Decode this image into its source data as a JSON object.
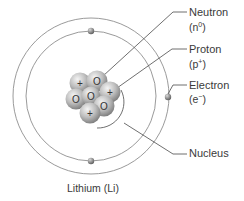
{
  "diagram": {
    "title": "Lithium (Li)",
    "element": "Lithium",
    "symbol": "Li",
    "labels": {
      "neutron": {
        "name": "Neutron",
        "symbol_base": "n",
        "symbol_charge": "0"
      },
      "proton": {
        "name": "Proton",
        "symbol_base": "p",
        "symbol_charge": "+"
      },
      "electron": {
        "name": "Electron",
        "symbol_base": "e",
        "symbol_charge": "−"
      },
      "nucleus": {
        "name": "Nucleus"
      }
    },
    "nucleus_particles": [
      {
        "type": "proton",
        "mark": "+",
        "x": 80,
        "y": 83
      },
      {
        "type": "neutron",
        "mark": "O",
        "x": 97,
        "y": 81
      },
      {
        "type": "proton",
        "mark": "+",
        "x": 110,
        "y": 92
      },
      {
        "type": "neutron",
        "mark": "O",
        "x": 76,
        "y": 99
      },
      {
        "type": "neutron",
        "mark": "O",
        "x": 91,
        "y": 97
      },
      {
        "type": "neutron",
        "mark": "O",
        "x": 104,
        "y": 106
      },
      {
        "type": "proton",
        "mark": "+",
        "x": 90,
        "y": 113
      }
    ],
    "counts": {
      "protons": 3,
      "neutrons": 4,
      "electrons": 3
    },
    "orbits": [
      {
        "shell": 1,
        "radius": 65
      },
      {
        "shell": 2,
        "radius": 78
      }
    ],
    "colors": {
      "orbit": "#8a8a8a",
      "leader": "#4a4a4a",
      "particle_light": "#eeeeee",
      "particle_dark": "#8c8c8c",
      "text": "#3a3a3a"
    }
  }
}
